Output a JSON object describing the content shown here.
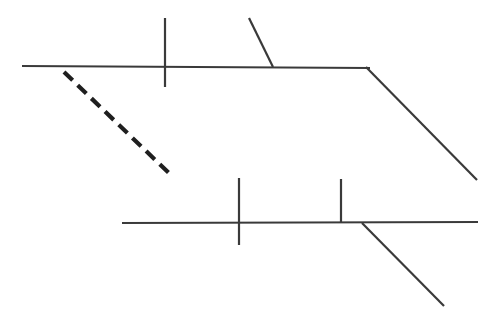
{
  "canvas": {
    "width": 496,
    "height": 323,
    "background_color": "#ffffff",
    "title": "Line Diagram"
  },
  "style": {
    "stroke_color": "#3a3a3a",
    "dashed_stroke_color": "#1f1f1f",
    "solid_stroke_width": 2.2,
    "tick_stroke_width": 2.2,
    "dashed_stroke_width": 4.2,
    "dash_pattern": "12 7"
  },
  "chart_data": {
    "type": "line",
    "xlabel": "",
    "ylabel": "",
    "xlim": [
      0,
      496
    ],
    "ylim": [
      0,
      323
    ],
    "grid": false,
    "legend": "none",
    "series": [
      {
        "name": "upper-horizontal-line",
        "style": "solid",
        "points": [
          [
            22,
            66
          ],
          [
            370,
            68
          ]
        ]
      },
      {
        "name": "upper-right-diagonal",
        "style": "solid",
        "points": [
          [
            366,
            67
          ],
          [
            477,
            180
          ]
        ]
      },
      {
        "name": "upper-vertical-tick",
        "style": "solid",
        "points": [
          [
            165,
            18
          ],
          [
            165,
            87
          ]
        ]
      },
      {
        "name": "upper-slanted-tick",
        "style": "solid",
        "points": [
          [
            249,
            18
          ],
          [
            273,
            67
          ]
        ]
      },
      {
        "name": "dashed-diagonal-line",
        "style": "dashed",
        "points": [
          [
            64,
            72
          ],
          [
            173,
            177
          ]
        ]
      },
      {
        "name": "lower-horizontal-line",
        "style": "solid",
        "points": [
          [
            122,
            223
          ],
          [
            478,
            222
          ]
        ]
      },
      {
        "name": "lower-right-diagonal",
        "style": "solid",
        "points": [
          [
            362,
            223
          ],
          [
            444,
            306
          ]
        ]
      },
      {
        "name": "lower-left-vertical-tick",
        "style": "solid",
        "points": [
          [
            239,
            178
          ],
          [
            239,
            245
          ]
        ]
      },
      {
        "name": "lower-right-vertical-tick",
        "style": "solid",
        "points": [
          [
            341,
            179
          ],
          [
            341,
            223
          ]
        ]
      }
    ]
  }
}
